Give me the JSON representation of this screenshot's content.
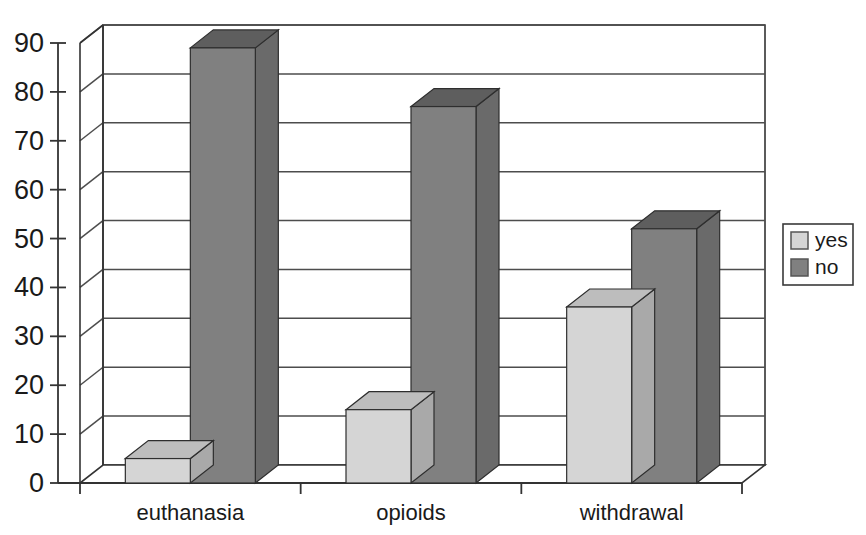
{
  "chart_data": {
    "type": "bar",
    "title": "",
    "subtitle": "",
    "xlabel": "",
    "ylabel": "",
    "categories": [
      "euthanasia",
      "opioids",
      "withdrawal"
    ],
    "series": [
      {
        "name": "yes",
        "values": [
          5,
          15,
          36
        ],
        "color": "#d5d5d5"
      },
      {
        "name": "no",
        "values": [
          89,
          77,
          52
        ],
        "color": "#808080"
      }
    ],
    "ylim": [
      0,
      90
    ],
    "yticks": [
      0,
      10,
      20,
      30,
      40,
      50,
      60,
      70,
      80,
      90
    ],
    "ytick_labels": [
      "0",
      "10",
      "20",
      "30",
      "40",
      "50",
      "60",
      "70",
      "80",
      "90"
    ],
    "grid": true,
    "legend": {
      "position": "right",
      "entries": [
        "yes",
        "no"
      ]
    },
    "style": "3d-column"
  },
  "legend": {
    "entries": [
      {
        "label": "yes",
        "swatch": "#d5d5d5"
      },
      {
        "label": "no",
        "swatch": "#808080"
      }
    ]
  },
  "colors": {
    "yes_front": "#d5d5d5",
    "yes_top": "#bdbdbd",
    "yes_side": "#a9a9a9",
    "no_front": "#808080",
    "no_top": "#5e5e5e",
    "no_side": "#6a6a6a",
    "axis": "#333333",
    "grid": "#4d4d4d",
    "text": "#1a1a1a"
  }
}
